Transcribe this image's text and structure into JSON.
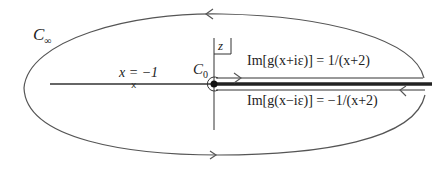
{
  "diagram": {
    "type": "contour-integral-keyhole",
    "colors": {
      "line": "#555555",
      "branch_cut": "#222222",
      "text": "#222222",
      "background": "#ffffff"
    },
    "labels": {
      "c_infinity": "C",
      "c_infinity_sub": "∞",
      "c_zero": "C",
      "c_zero_sub": "0",
      "x_equals": "x = −1",
      "z_plane": "z",
      "upper_edge": "Im[g(x+iε)] = 1/(x+2)",
      "lower_edge": "Im[g(x−iε)] = −1/(x+2)"
    },
    "elements": {
      "outer_contour": "large ellipse C∞ (counter-clockwise arrows)",
      "inner_contour": "small circle C0 around origin",
      "branch_cut": "thick line along positive real axis",
      "real_axis": "horizontal axis line",
      "imag_axis": "vertical axis line",
      "pole_marker": "x marker at x = -1",
      "arrows": [
        "top: left-pointing",
        "bottom: right-pointing",
        "upper edge: right-pointing",
        "lower edge: left-pointing"
      ]
    }
  }
}
